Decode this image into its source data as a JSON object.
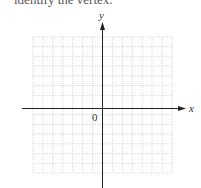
{
  "caption": "identify the vertex.",
  "axes": {
    "x_label": "x",
    "y_label": "y",
    "origin_label": "0"
  },
  "grid": {
    "columns": 14,
    "rows": 14,
    "line_color": "#b8b8b8",
    "axis_color": "#222222"
  }
}
